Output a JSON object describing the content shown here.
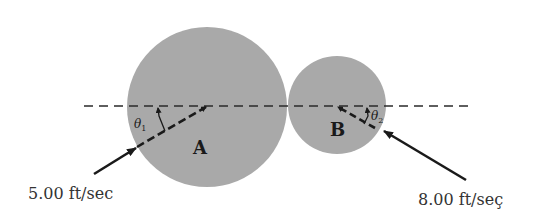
{
  "diagram": {
    "colors": {
      "ball_fill": "#a9a9a9",
      "line": "#1a1a1a",
      "background": "#ffffff"
    },
    "balls": [
      {
        "label": "A",
        "cx": 207,
        "cy": 107,
        "r": 80
      },
      {
        "label": "B",
        "cx": 337,
        "cy": 105,
        "r": 49
      }
    ],
    "line_of_impact": {
      "x1": 84,
      "x2": 468,
      "y": 106,
      "style": "dashed"
    },
    "angles": [
      {
        "symbol": "θ",
        "subscript": "1"
      },
      {
        "symbol": "θ",
        "subscript": "2"
      }
    ],
    "velocities": [
      {
        "label": "5.00 ft/sec",
        "ball": "A",
        "direction": "up-right"
      },
      {
        "label": "8.00 ft/seç",
        "ball": "B",
        "direction": "up-left"
      }
    ]
  }
}
